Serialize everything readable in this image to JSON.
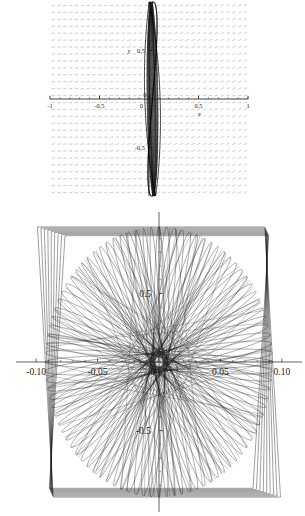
{
  "page": {
    "background_color": "#ffffff",
    "width": 305,
    "height": 516,
    "figure_count": 2
  },
  "chart_data": [
    {
      "id": "top-phase-portrait",
      "type": "line",
      "title": "",
      "subtitle": "",
      "xlabel": "x",
      "ylabel": "y",
      "xlim": [
        -1,
        1
      ],
      "ylim": [
        -1,
        1
      ],
      "xticks": [
        -1,
        -0.5,
        0,
        0.5,
        1
      ],
      "xticklabels": [
        "-1",
        "-0.5",
        "0",
        "0.5",
        "1"
      ],
      "yticks": [
        0.5,
        0,
        -0.5
      ],
      "yticklabels": [
        "0.5",
        "0",
        "-0.5"
      ],
      "grid": false,
      "legend": "none",
      "axis_style": "centered-cross",
      "background_layer": {
        "type": "vector-field",
        "color": "#a8a8a8",
        "arrow_count_x": 34,
        "arrow_count_y": 28,
        "description": "slope field of short diagonal arrows tilting up-right"
      },
      "series": [
        {
          "name": "trajectory",
          "color": "#111111",
          "description": "narrow tall closed orbit centered near x=0 spanning nearly full y range",
          "x_extent": [
            -0.03,
            0.1
          ],
          "y_extent": [
            -1.0,
            1.0
          ]
        }
      ]
    },
    {
      "id": "bottom-trajectory",
      "type": "line",
      "title": "",
      "subtitle": "",
      "xlabel": "",
      "ylabel": "",
      "xlim": [
        -0.105,
        0.105
      ],
      "ylim": [
        -1.05,
        1.05
      ],
      "xticks": [
        -0.1,
        -0.05,
        0,
        0.05,
        0.1
      ],
      "xticklabels": [
        "-0.10",
        "-0.05",
        "0",
        "0.05",
        "0.10"
      ],
      "yticks": [
        0.5,
        0,
        -0.5
      ],
      "yticklabels": [
        "0.5",
        "0",
        "-0.5"
      ],
      "grid": false,
      "legend": "none",
      "axis_style": "centered-cross",
      "minor_ticks_per_interval": 4,
      "series": [
        {
          "name": "orbit-family",
          "color": "#111111",
          "description": "dense web of near-straight chords forming a rounded-square envelope with a light lens-shaped interior",
          "line_count": 120
        }
      ]
    }
  ]
}
